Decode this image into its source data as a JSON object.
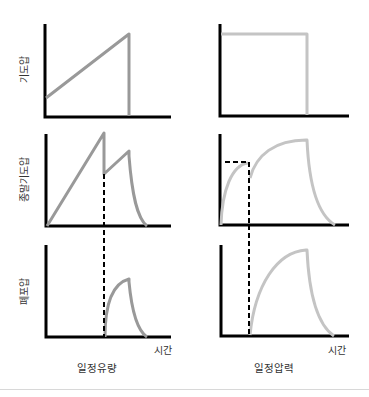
{
  "diagram": {
    "rows": [
      {
        "label": "기도압"
      },
      {
        "label": "종말기도압"
      },
      {
        "label": "폐포압"
      }
    ],
    "columns": [
      {
        "caption": "일정유량",
        "x_axis_label": "시간"
      },
      {
        "caption": "일정압력",
        "x_axis_label": "시간"
      }
    ],
    "colors": {
      "axis": "#000000",
      "curve_left": "#999999",
      "curve_right": "#c4c4c4",
      "dashed": "#000000",
      "divider": "#d8d8d8"
    }
  }
}
